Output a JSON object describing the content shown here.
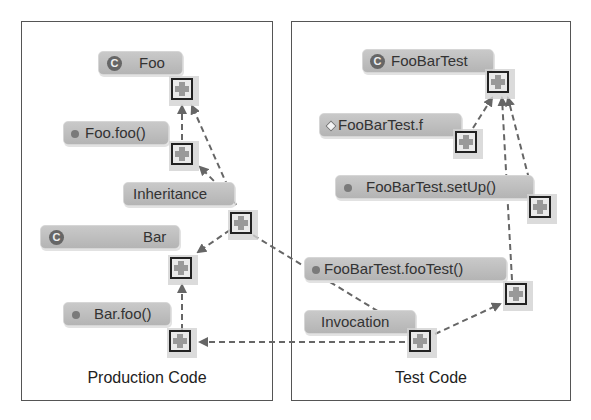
{
  "panels": {
    "production": {
      "title": "Production Code"
    },
    "test": {
      "title": "Test Code"
    }
  },
  "nodes": {
    "foo": {
      "label": "Foo",
      "icon": "class-c-icon"
    },
    "foo_method": {
      "label": "Foo.foo()",
      "icon": "method-dot-icon"
    },
    "inheritance": {
      "label": "Inheritance"
    },
    "bar": {
      "label": "Bar",
      "icon": "class-c-icon"
    },
    "bar_method": {
      "label": "Bar.foo()",
      "icon": "method-dot-icon"
    },
    "foobartest": {
      "label": "FooBarTest",
      "icon": "class-c-icon"
    },
    "foobartest_f": {
      "label": "FooBarTest.f",
      "icon": "field-diamond-icon"
    },
    "setup": {
      "label": "FooBarTest.setUp()",
      "icon": "method-dot-icon"
    },
    "footest": {
      "label": "FooBarTest.fooTest()",
      "icon": "method-dot-icon"
    },
    "invocation": {
      "label": "Invocation"
    }
  },
  "glyphs": {
    "class_letter": "C"
  },
  "colors": {
    "edge": "#666666",
    "node_fill": "#bebebe",
    "border": "#555555"
  }
}
